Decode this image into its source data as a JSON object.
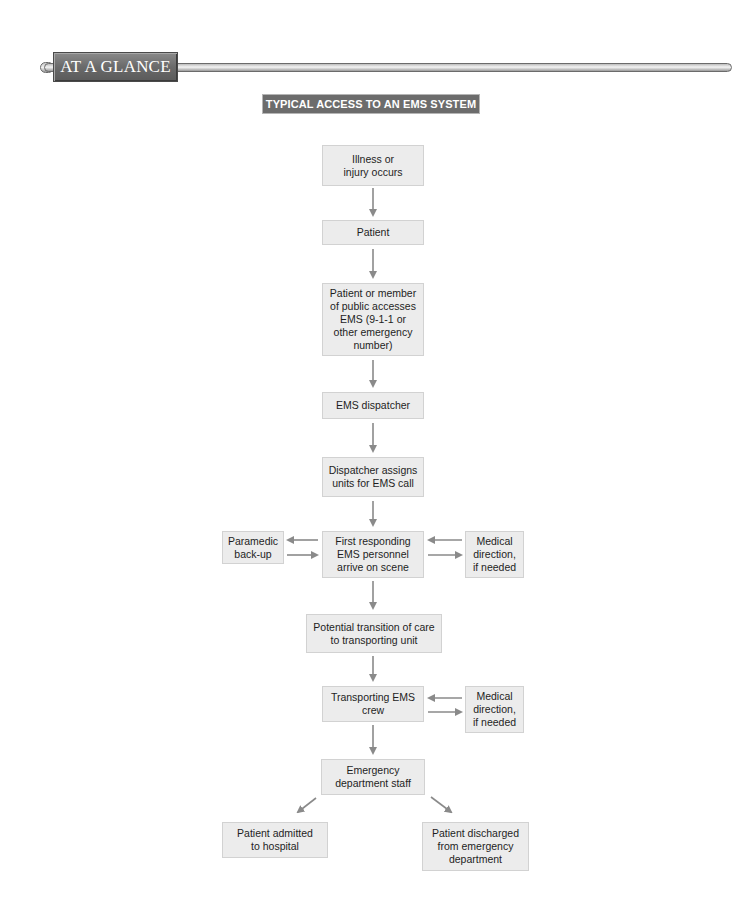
{
  "banner": {
    "label": "AT A GLANCE"
  },
  "chart_title": "TYPICAL ACCESS TO AN EMS SYSTEM",
  "colors": {
    "box_fill": "#ececec",
    "box_border": "#d2d2d2",
    "arrow": "#8a8a8a",
    "title_bg": "#6c6c6c",
    "banner_bg": "#6e6e6e"
  },
  "nodes": {
    "illness": "Illness or\ninjury occurs",
    "patient": "Patient",
    "access": "Patient or member\nof public accesses\nEMS (9-1-1 or\nother emergency\nnumber)",
    "dispatcher": "EMS dispatcher",
    "assigns": "Dispatcher assigns\nunits for EMS call",
    "paramedic": "Paramedic\nback-up",
    "first_responding": "First responding\nEMS personnel\narrive on scene",
    "medical_direction_1": "Medical\ndirection,\nif needed",
    "transition": "Potential transition of care\nto transporting unit",
    "transporting": "Transporting EMS\ncrew",
    "medical_direction_2": "Medical\ndirection,\nif needed",
    "ed_staff": "Emergency\ndepartment staff",
    "admitted": "Patient admitted\nto hospital",
    "discharged": "Patient discharged\nfrom emergency\ndepartment"
  },
  "edges": [
    [
      "illness",
      "patient"
    ],
    [
      "patient",
      "access"
    ],
    [
      "access",
      "dispatcher"
    ],
    [
      "dispatcher",
      "assigns"
    ],
    [
      "assigns",
      "first_responding"
    ],
    [
      "first_responding",
      "paramedic"
    ],
    [
      "paramedic",
      "first_responding"
    ],
    [
      "medical_direction_1",
      "first_responding"
    ],
    [
      "first_responding",
      "medical_direction_1"
    ],
    [
      "first_responding",
      "transition"
    ],
    [
      "transition",
      "transporting"
    ],
    [
      "medical_direction_2",
      "transporting"
    ],
    [
      "transporting",
      "medical_direction_2"
    ],
    [
      "transporting",
      "ed_staff"
    ],
    [
      "ed_staff",
      "admitted"
    ],
    [
      "ed_staff",
      "discharged"
    ]
  ]
}
